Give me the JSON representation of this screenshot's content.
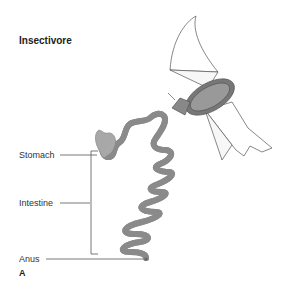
{
  "diagram": {
    "title": "Insectivore",
    "panel_label": "A",
    "labels": {
      "stomach": "Stomach",
      "intestine": "Intestine",
      "anus": "Anus"
    },
    "illustration": "bat",
    "colors": {
      "gut_fill": "#c8c8c8",
      "gut_stroke": "#8a8a8a",
      "stomach_fill": "#aaaaaa",
      "leader_line": "#555555"
    }
  }
}
